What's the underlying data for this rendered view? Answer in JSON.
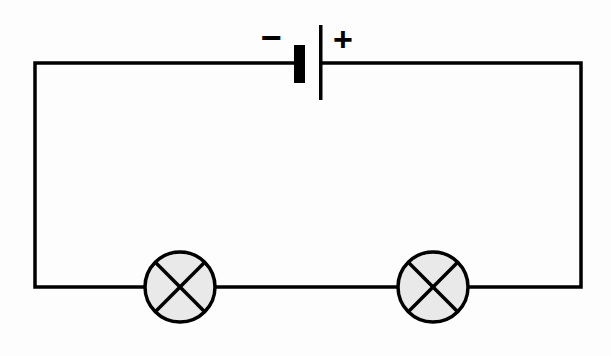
{
  "diagram": {
    "type": "series-circuit",
    "components": [
      {
        "id": "battery",
        "kind": "cell",
        "negative_label": "−",
        "positive_label": "+"
      },
      {
        "id": "lamp1",
        "kind": "lamp"
      },
      {
        "id": "lamp2",
        "kind": "lamp"
      }
    ],
    "colors": {
      "wire": "#000000",
      "lamp_fill": "#e9e9e9",
      "background": "#fdfdfd"
    }
  }
}
